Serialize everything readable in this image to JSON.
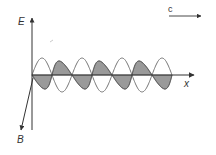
{
  "diagram": {
    "labels": {
      "e_axis": "E",
      "b_axis": "B",
      "x_axis": "x",
      "velocity": "c"
    },
    "colors": {
      "axis": "#333333",
      "wave_line": "#666666",
      "shade_fill": "#9a9a9a",
      "background": "#ffffff"
    },
    "wave": {
      "origin_x": 32,
      "axis_y": 75,
      "wavelength_px": 40,
      "amplitude_px": 17,
      "periods": 3.5,
      "shaded_component": "B"
    }
  }
}
